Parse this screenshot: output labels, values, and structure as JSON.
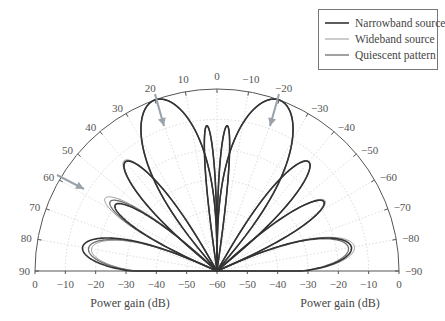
{
  "chart_data": {
    "type": "polar-line",
    "title": "",
    "radial_axis": {
      "label": "Power gain (dB)",
      "range_db": [
        -60,
        0
      ],
      "left_ticks": [
        "0",
        "−10",
        "−20",
        "−30",
        "−40",
        "−50",
        "−60"
      ],
      "right_ticks": [
        "−60",
        "−50",
        "−40",
        "−30",
        "−20",
        "−10",
        "0"
      ]
    },
    "angular_axis": {
      "range_deg": [
        -90,
        90
      ],
      "ticks": [
        {
          "angle": 0,
          "label": "0"
        },
        {
          "angle": 10,
          "label": "10"
        },
        {
          "angle": 20,
          "label": "20"
        },
        {
          "angle": 30,
          "label": "30"
        },
        {
          "angle": 40,
          "label": "40"
        },
        {
          "angle": 50,
          "label": "50"
        },
        {
          "angle": 60,
          "label": "60"
        },
        {
          "angle": 70,
          "label": "70"
        },
        {
          "angle": 80,
          "label": "80"
        },
        {
          "angle": 90,
          "label": "90"
        },
        {
          "angle": -10,
          "label": "−10"
        },
        {
          "angle": -20,
          "label": "−20"
        },
        {
          "angle": -30,
          "label": "−30"
        },
        {
          "angle": -40,
          "label": "−40"
        },
        {
          "angle": -50,
          "label": "−50"
        },
        {
          "angle": -60,
          "label": "−60"
        },
        {
          "angle": -70,
          "label": "−70"
        },
        {
          "angle": -80,
          "label": "−80"
        },
        {
          "angle": -90,
          "label": "−90"
        }
      ]
    },
    "legend": {
      "position": "top-right",
      "entries": [
        {
          "name": "Narrowband source",
          "color": "#333333",
          "width": 1.6
        },
        {
          "name": "Wideband source",
          "color": "#9a9a9a",
          "width": 1.0
        },
        {
          "name": "Quiescent pattern",
          "color": "#6e6e6e",
          "width": 1.3
        }
      ]
    },
    "series": [
      {
        "name": "Quiescent pattern",
        "lobes": [
          {
            "center": 20,
            "half_width": 20,
            "peak_db": 0
          },
          {
            "center": -20,
            "half_width": 20,
            "peak_db": 0
          },
          {
            "center": 4,
            "half_width": 4,
            "peak_db": -12
          },
          {
            "center": -4,
            "half_width": 4,
            "peak_db": -12
          },
          {
            "center": 40,
            "half_width": 10,
            "peak_db": -13
          },
          {
            "center": -40,
            "half_width": 10,
            "peak_db": -13
          },
          {
            "center": 57,
            "half_width": 9,
            "peak_db": -18
          },
          {
            "center": -57,
            "half_width": 9,
            "peak_db": -18
          },
          {
            "center": 80,
            "half_width": 14,
            "peak_db": -17
          },
          {
            "center": -80,
            "half_width": 14,
            "peak_db": -16
          }
        ]
      },
      {
        "name": "Narrowband source",
        "lobes": [
          {
            "center": 20,
            "half_width": 20,
            "peak_db": 0
          },
          {
            "center": -20,
            "half_width": 20,
            "peak_db": 0
          },
          {
            "center": 4,
            "half_width": 4,
            "peak_db": -12
          },
          {
            "center": -4,
            "half_width": 4,
            "peak_db": -12
          },
          {
            "center": 40,
            "half_width": 10,
            "peak_db": -13
          },
          {
            "center": -40,
            "half_width": 10,
            "peak_db": -13
          },
          {
            "center": 57,
            "half_width": 9,
            "peak_db": -20
          },
          {
            "center": -57,
            "half_width": 9,
            "peak_db": -18
          },
          {
            "center": 80,
            "half_width": 14,
            "peak_db": -15
          },
          {
            "center": -80,
            "half_width": 14,
            "peak_db": -15
          }
        ]
      },
      {
        "name": "Wideband source",
        "lobes": [
          {
            "center": 20,
            "half_width": 20,
            "peak_db": 0
          },
          {
            "center": -20,
            "half_width": 20,
            "peak_db": 0
          },
          {
            "center": 4,
            "half_width": 4,
            "peak_db": -12
          },
          {
            "center": -4,
            "half_width": 4,
            "peak_db": -12
          },
          {
            "center": 40,
            "half_width": 10,
            "peak_db": -12.5
          },
          {
            "center": -40,
            "half_width": 10,
            "peak_db": -13
          },
          {
            "center": 57,
            "half_width": 9,
            "peak_db": -16
          },
          {
            "center": -57,
            "half_width": 9,
            "peak_db": -17.5
          },
          {
            "center": 80,
            "half_width": 14,
            "peak_db": -18
          },
          {
            "center": -80,
            "half_width": 14,
            "peak_db": -14
          }
        ]
      }
    ],
    "annotations": [
      {
        "type": "arrow",
        "from_angle": 20,
        "note": "arrow pointing into main lobe at +20°"
      },
      {
        "type": "arrow",
        "from_angle": -20,
        "note": "arrow pointing into main lobe at −20°"
      },
      {
        "type": "arrow",
        "from_angle": 60,
        "note": "arrow indicating interference direction at 60°"
      }
    ],
    "grid": true
  }
}
